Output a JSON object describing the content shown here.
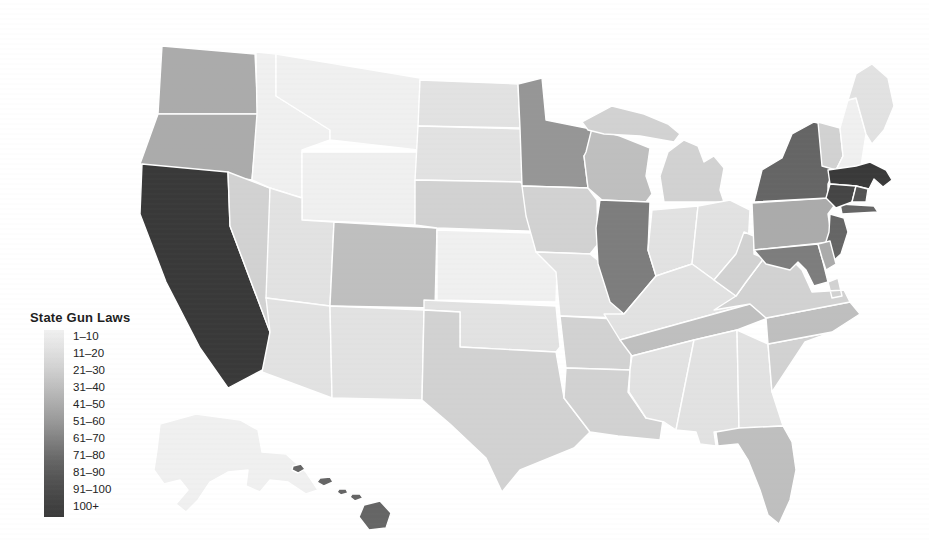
{
  "page": {
    "background": "#ffffff"
  },
  "legend": {
    "title": "State Gun Laws",
    "buckets": [
      {
        "label": "1–10",
        "color": "#f0f0f0"
      },
      {
        "label": "11–20",
        "color": "#e2e2e2"
      },
      {
        "label": "21–30",
        "color": "#d2d2d2"
      },
      {
        "label": "31–40",
        "color": "#bfbfbf"
      },
      {
        "label": "41–50",
        "color": "#ababab"
      },
      {
        "label": "51–60",
        "color": "#969696"
      },
      {
        "label": "61–70",
        "color": "#7d7d7d"
      },
      {
        "label": "71–80",
        "color": "#656565"
      },
      {
        "label": "81–90",
        "color": "#535353"
      },
      {
        "label": "91–100",
        "color": "#454545"
      },
      {
        "label": "100+",
        "color": "#393939"
      }
    ]
  },
  "chart_data": {
    "type": "choropleth",
    "region": "United States (50 states)",
    "title": "State Gun Laws",
    "legend_position": "left",
    "palette": "light-gray (few laws) to dark-gray (many laws)",
    "bucket_labels": [
      "1–10",
      "11–20",
      "21–30",
      "31–40",
      "41–50",
      "51–60",
      "61–70",
      "71–80",
      "81–90",
      "91–100",
      "100+"
    ],
    "states": {
      "AL": "11–20",
      "AK": "1–10",
      "AZ": "11–20",
      "AR": "21–30",
      "CA": "100+",
      "CO": "31–40",
      "CT": "91–100",
      "DE": "41–50",
      "FL": "31–40",
      "GA": "11–20",
      "HI": "71–80",
      "ID": "1–10",
      "IL": "61–70",
      "IN": "11–20",
      "IA": "21–30",
      "KS": "1–10",
      "KY": "11–20",
      "LA": "21–30",
      "ME": "11–20",
      "MD": "61–70",
      "MA": "100+",
      "MI": "21–30",
      "MN": "51–60",
      "MS": "11–20",
      "MO": "11–20",
      "MT": "1–10",
      "NE": "21–30",
      "NV": "21–30",
      "NH": "1–10",
      "NJ": "71–80",
      "NM": "11–20",
      "NY": "71–80",
      "NC": "31–40",
      "ND": "11–20",
      "OH": "11–20",
      "OK": "11–20",
      "OR": "41–50",
      "PA": "41–50",
      "RI": "81–90",
      "SC": "21–30",
      "SD": "11–20",
      "TN": "31–40",
      "TX": "21–30",
      "UT": "11–20",
      "VT": "21–30",
      "VA": "21–30",
      "WA": "41–50",
      "WV": "21–30",
      "WI": "31–40",
      "WY": "1–10"
    }
  }
}
